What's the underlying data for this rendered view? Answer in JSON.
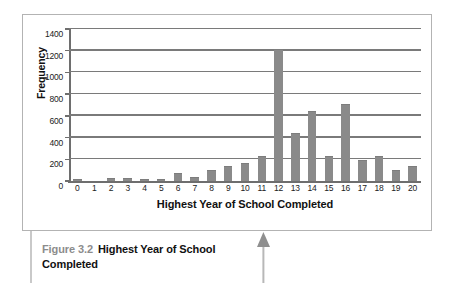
{
  "figure": {
    "caption_number": "Figure 3.2",
    "caption_text": "Highest Year of School Completed"
  },
  "annotations": {
    "pointer_arrow": "up-arrow"
  },
  "chart_data": {
    "type": "bar",
    "title": "",
    "xlabel": "Highest Year of School Completed",
    "ylabel": "Frequency",
    "categories": [
      "0",
      "1",
      "2",
      "3",
      "4",
      "5",
      "6",
      "7",
      "8",
      "9",
      "10",
      "11",
      "12",
      "13",
      "14",
      "15",
      "16",
      "17",
      "18",
      "19",
      "20"
    ],
    "values": [
      12,
      0,
      15,
      15,
      5,
      12,
      65,
      25,
      88,
      130,
      158,
      220,
      1210,
      435,
      635,
      220,
      700,
      185,
      220,
      95,
      128
    ],
    "ylim": [
      0,
      1400
    ],
    "yticks": [
      0,
      200,
      400,
      600,
      800,
      1000,
      1200,
      1400
    ],
    "ytick_labels": [
      "0",
      "200",
      "400",
      "600",
      "800",
      "1000",
      "1200",
      "1400"
    ],
    "grid": "horizontal",
    "legend": "none",
    "bar_color": "#8a8a8a",
    "plot_background": "#ffffff",
    "gridline_color": "#7a7a7a"
  }
}
